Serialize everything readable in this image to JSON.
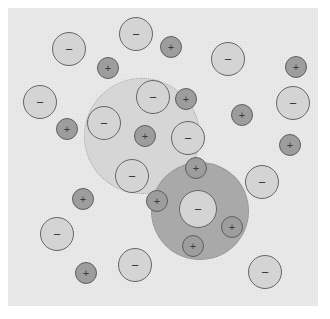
{
  "figure": {
    "width": 330,
    "height": 319,
    "panel": {
      "x": 8,
      "y": 8,
      "width": 310,
      "height": 298,
      "background_color": "#ececec"
    }
  },
  "legend": {
    "anion_symbol": "−",
    "cation_symbol": "+",
    "anion_fill": "#d4d4d4",
    "anion_stroke": "#666666",
    "cation_fill": "#9d9d9d",
    "cation_stroke": "#5e5e5e"
  },
  "shells": [
    {
      "name": "upper-left-shell",
      "shade": "light",
      "fill_color": "#d6d6d6",
      "border_color": "#a9a9a9",
      "cx": 142,
      "cy": 136,
      "r": 58
    },
    {
      "name": "lower-right-shell",
      "shade": "dark",
      "fill_color": "#a9a9a9",
      "border_color": "#8a8a8a",
      "cx": 200,
      "cy": 211,
      "r": 49
    }
  ],
  "ions": [
    {
      "name": "anion-1",
      "charge": "−",
      "type": "anion",
      "cx": 69,
      "cy": 49,
      "r": 17
    },
    {
      "name": "anion-2",
      "charge": "−",
      "type": "anion",
      "cx": 136,
      "cy": 34,
      "r": 17
    },
    {
      "name": "cation-1",
      "charge": "+",
      "type": "cation",
      "cx": 171,
      "cy": 47,
      "r": 11
    },
    {
      "name": "anion-3",
      "charge": "−",
      "type": "anion",
      "cx": 228,
      "cy": 59,
      "r": 17
    },
    {
      "name": "cation-2",
      "charge": "+",
      "type": "cation",
      "cx": 108,
      "cy": 68,
      "r": 11
    },
    {
      "name": "cation-3",
      "charge": "+",
      "type": "cation",
      "cx": 296,
      "cy": 67,
      "r": 11
    },
    {
      "name": "anion-4",
      "charge": "−",
      "type": "anion",
      "cx": 40,
      "cy": 102,
      "r": 17
    },
    {
      "name": "anion-5",
      "charge": "−",
      "type": "anion",
      "cx": 153,
      "cy": 97,
      "r": 17
    },
    {
      "name": "cation-4",
      "charge": "+",
      "type": "cation",
      "cx": 186,
      "cy": 99,
      "r": 11
    },
    {
      "name": "anion-6",
      "charge": "−",
      "type": "anion",
      "cx": 293,
      "cy": 103,
      "r": 17
    },
    {
      "name": "cation-5",
      "charge": "+",
      "type": "cation",
      "cx": 67,
      "cy": 129,
      "r": 11
    },
    {
      "name": "anion-7",
      "charge": "−",
      "type": "anion",
      "cx": 104,
      "cy": 123,
      "r": 17
    },
    {
      "name": "cation-6",
      "charge": "+",
      "type": "cation",
      "cx": 145,
      "cy": 136,
      "r": 11
    },
    {
      "name": "anion-8",
      "charge": "−",
      "type": "anion",
      "cx": 188,
      "cy": 138,
      "r": 17
    },
    {
      "name": "cation-7",
      "charge": "+",
      "type": "cation",
      "cx": 242,
      "cy": 115,
      "r": 11
    },
    {
      "name": "cation-8",
      "charge": "+",
      "type": "cation",
      "cx": 290,
      "cy": 145,
      "r": 11
    },
    {
      "name": "anion-9",
      "charge": "−",
      "type": "anion",
      "cx": 132,
      "cy": 176,
      "r": 17
    },
    {
      "name": "cation-9",
      "charge": "+",
      "type": "cation",
      "cx": 196,
      "cy": 168,
      "r": 11
    },
    {
      "name": "cation-10",
      "charge": "+",
      "type": "cation",
      "cx": 83,
      "cy": 199,
      "r": 11
    },
    {
      "name": "cation-11",
      "charge": "+",
      "type": "cation",
      "cx": 157,
      "cy": 201,
      "r": 11
    },
    {
      "name": "anion-10",
      "charge": "−",
      "type": "anion",
      "cx": 198,
      "cy": 209,
      "r": 19
    },
    {
      "name": "anion-11",
      "charge": "−",
      "type": "anion",
      "cx": 262,
      "cy": 182,
      "r": 17
    },
    {
      "name": "cation-12",
      "charge": "+",
      "type": "cation",
      "cx": 232,
      "cy": 227,
      "r": 11
    },
    {
      "name": "anion-12",
      "charge": "−",
      "type": "anion",
      "cx": 57,
      "cy": 234,
      "r": 17
    },
    {
      "name": "cation-13",
      "charge": "+",
      "type": "cation",
      "cx": 193,
      "cy": 246,
      "r": 11
    },
    {
      "name": "cation-14",
      "charge": "+",
      "type": "cation",
      "cx": 86,
      "cy": 273,
      "r": 11
    },
    {
      "name": "anion-13",
      "charge": "−",
      "type": "anion",
      "cx": 135,
      "cy": 265,
      "r": 17
    },
    {
      "name": "anion-14",
      "charge": "−",
      "type": "anion",
      "cx": 265,
      "cy": 272,
      "r": 17
    }
  ]
}
